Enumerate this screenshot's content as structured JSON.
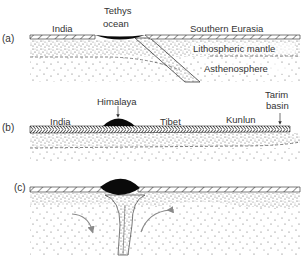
{
  "figure": {
    "panels": [
      {
        "id": "a",
        "label": "(a)",
        "annotations": {
          "india": "India",
          "tethys_line1": "Tethys",
          "tethys_line2": "ocean",
          "southern_eurasia": "Southern Eurasia",
          "lithospheric_mantle": "Lithospheric mantle",
          "asthenosphere": "Asthenosphere"
        }
      },
      {
        "id": "b",
        "label": "(b)",
        "annotations": {
          "india": "India",
          "himalaya": "Himalaya",
          "tibet": "Tibet",
          "kunlun": "Kunlun",
          "tarim_line1": "Tarim",
          "tarim_line2": "basin"
        }
      },
      {
        "id": "c",
        "label": "(c)",
        "annotations": {}
      }
    ],
    "colors": {
      "line": "#222222",
      "black_mass": "#0a0a0a",
      "arrow": "#8a8a8a",
      "text": "#333333",
      "background": "#ffffff"
    }
  }
}
